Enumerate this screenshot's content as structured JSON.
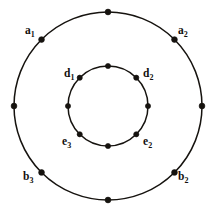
{
  "figure": {
    "type": "concentric-circle-graph-diagram",
    "background_color": "#ffffff",
    "ink_color": "#16130f",
    "canvas": {
      "width": 216,
      "height": 215
    },
    "center": {
      "x": 108,
      "y": 106
    },
    "outer_circle": {
      "name": "outer-circle",
      "radius": 94,
      "stroke_width": 1.5,
      "vertex_count": 8,
      "vertex_angles_deg": [
        0,
        45,
        90,
        135,
        180,
        225,
        270,
        315
      ],
      "vertex_dot_radius": 2.9
    },
    "inner_circle": {
      "name": "inner-circle",
      "radius": 40,
      "stroke_width": 1.5,
      "vertex_count": 8,
      "vertex_angles_deg": [
        0,
        45,
        90,
        135,
        180,
        225,
        270,
        315
      ],
      "vertex_dot_radius": 2.6
    },
    "labels": [
      {
        "id": "a1",
        "text": "a",
        "sub": "1",
        "circle": "outer",
        "angle_deg": 135,
        "x": 25,
        "y": 25
      },
      {
        "id": "a2",
        "text": "a",
        "sub": "2",
        "circle": "outer",
        "angle_deg": 45,
        "x": 178,
        "y": 25
      },
      {
        "id": "d1",
        "text": "d",
        "sub": "1",
        "circle": "inner",
        "angle_deg": 135,
        "x": 64,
        "y": 68
      },
      {
        "id": "d2",
        "text": "d",
        "sub": "2",
        "circle": "inner",
        "angle_deg": 45,
        "x": 143,
        "y": 68
      },
      {
        "id": "e3",
        "text": "e",
        "sub": "3",
        "circle": "inner",
        "angle_deg": 225,
        "x": 62,
        "y": 136
      },
      {
        "id": "e2",
        "text": "e",
        "sub": "2",
        "circle": "inner",
        "angle_deg": 315,
        "x": 143,
        "y": 136
      },
      {
        "id": "b3",
        "text": "b",
        "sub": "3",
        "circle": "outer",
        "angle_deg": 225,
        "x": 23,
        "y": 171
      },
      {
        "id": "b2",
        "text": "b",
        "sub": "2",
        "circle": "outer",
        "angle_deg": 315,
        "x": 178,
        "y": 171
      }
    ]
  }
}
